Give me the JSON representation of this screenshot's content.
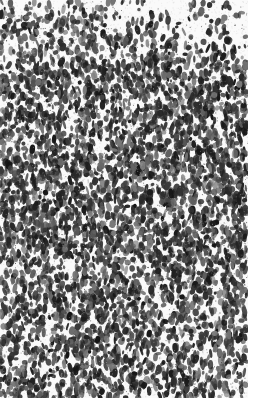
{
  "image": {
    "subject": "grayscale micrograph of densely stained cells (histological section)",
    "width": 257,
    "height": 398,
    "background_color": "#fafafa",
    "cell_color": "#1e1e1e",
    "cell_color_light": "#6a6a6a",
    "tissue_right_edge": 248,
    "upper_boundary": {
      "description": "lighter, sparser zone at top right with fuzzy edge",
      "left_y": 4,
      "right_y": 60
    },
    "density_bands": [
      {
        "y_from": 0,
        "y_to": 60,
        "density": 0.55
      },
      {
        "y_from": 60,
        "y_to": 150,
        "density": 0.85
      },
      {
        "y_from": 150,
        "y_to": 260,
        "density": 1.0
      },
      {
        "y_from": 260,
        "y_to": 398,
        "density": 0.8
      }
    ],
    "cell_count": 5200,
    "seed": 1337
  }
}
